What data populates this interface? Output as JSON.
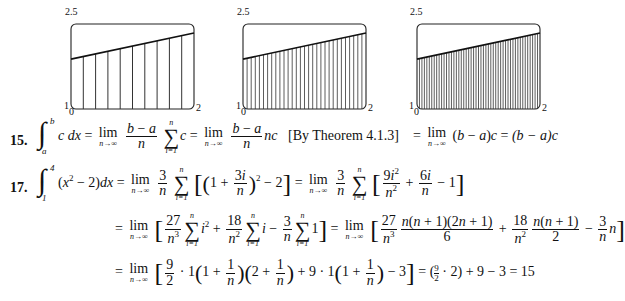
{
  "figures": [
    {
      "name": "graph-n10",
      "strips": 10,
      "y_top_label": "2.5",
      "y_bottom_label": "1",
      "x_left_label": "0",
      "x_right_label": "2"
    },
    {
      "name": "graph-n30",
      "strips": 30,
      "y_top_label": "2.5",
      "y_bottom_label": "1",
      "x_left_label": "0",
      "x_right_label": "2"
    },
    {
      "name": "graph-n50",
      "strips": 50,
      "y_top_label": "2.5",
      "y_bottom_label": "1",
      "x_left_label": "0",
      "x_right_label": "2"
    }
  ],
  "chart_data": [
    {
      "type": "area",
      "title": "",
      "xlabel": "",
      "ylabel": "",
      "xlim": [
        0,
        2
      ],
      "ylim": [
        1,
        2.5
      ],
      "rectangles": 10,
      "curve": {
        "x": [
          0,
          2
        ],
        "y": [
          1.88,
          2.34
        ]
      },
      "tick_labels": {
        "x": [
          "0",
          "2"
        ],
        "y": [
          "1",
          "2.5"
        ]
      }
    },
    {
      "type": "area",
      "title": "",
      "xlabel": "",
      "ylabel": "",
      "xlim": [
        0,
        2
      ],
      "ylim": [
        1,
        2.5
      ],
      "rectangles": 30,
      "curve": {
        "x": [
          0,
          2
        ],
        "y": [
          1.88,
          2.34
        ]
      },
      "tick_labels": {
        "x": [
          "0",
          "2"
        ],
        "y": [
          "1",
          "2.5"
        ]
      }
    },
    {
      "type": "area",
      "title": "",
      "xlabel": "",
      "ylabel": "",
      "xlim": [
        0,
        2
      ],
      "ylim": [
        1,
        2.5
      ],
      "rectangles": 50,
      "curve": {
        "x": [
          0,
          2
        ],
        "y": [
          1.88,
          2.34
        ]
      },
      "tick_labels": {
        "x": [
          "0",
          "2"
        ],
        "y": [
          "1",
          "2.5"
        ]
      }
    }
  ],
  "problems": [
    {
      "number": "15.",
      "theorem_note": "[By Theorem 4.1.3]",
      "result": "(b − a)c"
    },
    {
      "number": "17.",
      "result": "15"
    }
  ]
}
